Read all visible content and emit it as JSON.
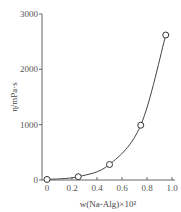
{
  "chart_data": {
    "type": "line",
    "title": "",
    "xlabel": "w(Na-Alg)×10²",
    "ylabel": "η/mPa·s",
    "xlim": [
      0,
      1.0
    ],
    "ylim": [
      0,
      3000
    ],
    "x_ticks": [
      "0",
      "0.2",
      "0.4",
      "0.6",
      "0.8",
      "1.0"
    ],
    "y_ticks": [
      "0",
      "1000",
      "2000",
      "3000"
    ],
    "grid": false,
    "legend": null,
    "series": [
      {
        "name": "η",
        "marker": "open-circle",
        "x": [
          0,
          0.25,
          0.5,
          0.75,
          0.95
        ],
        "values": [
          10,
          60,
          280,
          990,
          2620
        ]
      }
    ],
    "colors": {
      "line": "#444444",
      "axis": "#666666",
      "text": "#555555"
    }
  }
}
